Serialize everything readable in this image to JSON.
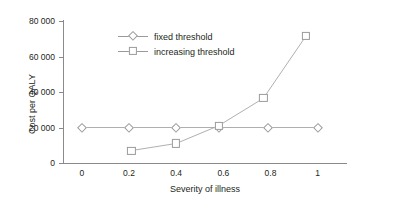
{
  "chart_data": {
    "type": "line",
    "title": "",
    "xlabel": "Severity of illness",
    "ylabel": "Cost per QALY",
    "xlim": [
      -0.08,
      1.12
    ],
    "ylim": [
      0,
      80000
    ],
    "grid": false,
    "legend_position": "upper-left-inside",
    "xticks": [
      "0",
      "0.2",
      "0.4",
      "0.6",
      "0.8",
      "1"
    ],
    "xtick_values": [
      0,
      0.2,
      0.4,
      0.6,
      0.8,
      1
    ],
    "yticks": [
      "0",
      "20 000",
      "40 000",
      "60 000",
      "80 000"
    ],
    "ytick_values": [
      0,
      20000,
      40000,
      60000,
      80000
    ],
    "series": [
      {
        "name": "fixed threshold",
        "marker": "diamond",
        "color": "#9a9a9a",
        "x": [
          0,
          0.2,
          0.4,
          0.58,
          0.79,
          1
        ],
        "values": [
          20000,
          20000,
          20000,
          20000,
          20000,
          20000
        ]
      },
      {
        "name": "increasing threshold",
        "marker": "square",
        "color": "#9a9a9a",
        "x": [
          0.21,
          0.4,
          0.58,
          0.77,
          0.95
        ],
        "values": [
          7000,
          11000,
          21000,
          36500,
          71500
        ]
      }
    ]
  },
  "legend": {
    "items": [
      {
        "label": "fixed threshold",
        "marker": "diamond-marker"
      },
      {
        "label": "increasing threshold",
        "marker": "square-marker"
      }
    ]
  }
}
